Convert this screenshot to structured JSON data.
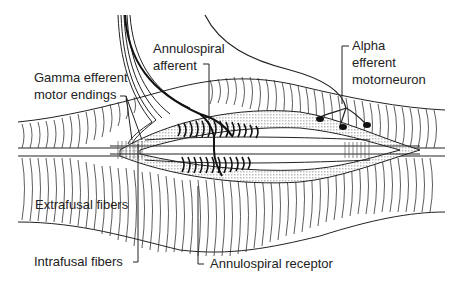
{
  "diagram": {
    "colors": {
      "line": "#222222",
      "stipple": "#d9d9d9",
      "background": "#ffffff"
    },
    "labels": {
      "annulospiral_afferent": {
        "line1": "Annulospiral",
        "line2": "afferent"
      },
      "alpha_efferent": {
        "line1": "Alpha",
        "line2": "efferent",
        "line3": "motorneuron"
      },
      "gamma_efferent": {
        "line1": "Gamma efferent",
        "line2": "motor endings"
      },
      "extrafusal": {
        "text": "Extrafusal fibers"
      },
      "intrafusal": {
        "text": "Intrafusal fibers"
      },
      "annulospiral_receptor": {
        "text": "Annulospiral receptor"
      }
    }
  }
}
